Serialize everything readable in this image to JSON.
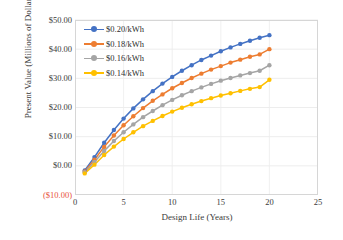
{
  "chart_data": {
    "type": "line",
    "title": "",
    "xlabel": "Design Life (Years)",
    "ylabel": "Present Value (Millions of Dollars)",
    "xlim": [
      0,
      25
    ],
    "ylim": [
      -10,
      50
    ],
    "xticks": [
      "0",
      "5",
      "10",
      "15",
      "20",
      "25"
    ],
    "xtick_values": [
      0,
      5,
      10,
      15,
      20,
      25
    ],
    "yticks": [
      "($10.00)",
      "$0.00",
      "$10.00",
      "$20.00",
      "$30.00",
      "$40.00",
      "$50.00"
    ],
    "ytick_values": [
      -10,
      0,
      10,
      20,
      30,
      40,
      50
    ],
    "grid": true,
    "legend_position": "top-left",
    "x": [
      1,
      2,
      3,
      4,
      5,
      6,
      7,
      8,
      9,
      10,
      11,
      12,
      13,
      14,
      15,
      16,
      17,
      18,
      19,
      20
    ],
    "series": [
      {
        "name": "$0.20/kWh",
        "color": "#4472C4",
        "values": [
          -1.6,
          3.0,
          7.9,
          12.3,
          16.2,
          19.7,
          22.8,
          25.6,
          28.2,
          30.5,
          32.6,
          34.5,
          36.3,
          37.8,
          39.3,
          40.6,
          41.8,
          42.9,
          43.9,
          44.8
        ]
      },
      {
        "name": "$0.18/kWh",
        "color": "#ED7D31",
        "values": [
          -1.9,
          2.1,
          6.5,
          10.4,
          13.9,
          17.0,
          19.8,
          22.3,
          24.5,
          26.6,
          28.4,
          30.1,
          31.6,
          33.0,
          34.2,
          35.4,
          36.4,
          37.4,
          38.2,
          40.0
        ]
      },
      {
        "name": "$0.16/kWh",
        "color": "#A5A5A5",
        "values": [
          -2.2,
          1.3,
          5.1,
          8.5,
          11.5,
          14.2,
          16.7,
          18.8,
          20.8,
          22.6,
          24.2,
          25.6,
          26.9,
          28.1,
          29.2,
          30.1,
          31.0,
          31.8,
          32.6,
          34.5
        ]
      },
      {
        "name": "$0.14/kWh",
        "color": "#FFC000",
        "values": [
          -2.6,
          0.4,
          3.7,
          6.6,
          9.2,
          11.5,
          13.6,
          15.4,
          17.1,
          18.6,
          19.9,
          21.1,
          22.2,
          23.2,
          24.1,
          24.9,
          25.7,
          26.4,
          27.0,
          29.5
        ]
      }
    ]
  }
}
